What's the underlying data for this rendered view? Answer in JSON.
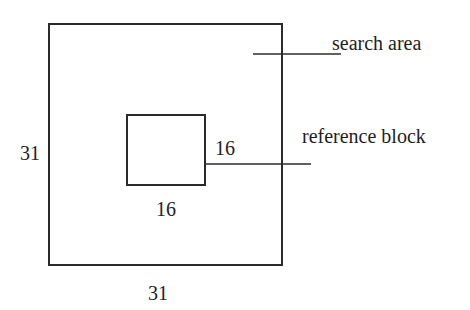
{
  "diagram": {
    "type": "block-matching search window",
    "colors": {
      "background": "#ffffff",
      "stroke": "#2b2b2b",
      "text": "#1e1e1e"
    },
    "search_area": {
      "label": "search area",
      "width_label": "31",
      "height_label": "31",
      "box": {
        "x": 49,
        "y": 24,
        "w": 233,
        "h": 241
      }
    },
    "reference_block": {
      "label": "reference block",
      "width_label": "16",
      "height_label": "16",
      "box": {
        "x": 127,
        "y": 115,
        "w": 78,
        "h": 70
      }
    },
    "leaders": [
      {
        "target": "search area",
        "x1": 253,
        "y1": 54,
        "x2": 341,
        "y2": 54
      },
      {
        "target": "reference block",
        "x1": 205,
        "y1": 164,
        "x2": 311,
        "y2": 164
      }
    ]
  }
}
